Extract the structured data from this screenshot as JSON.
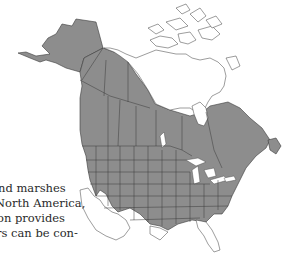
{
  "figure": {
    "type": "range-map",
    "region": "North America",
    "range_color": "#8c8c8c",
    "outline_color": "#3a3a3a",
    "background": "#ffffff"
  },
  "body_text": {
    "lines": [
      {
        "text": "nd marshes",
        "offset": -2
      },
      {
        "text": "North America,",
        "offset": -5
      },
      {
        "text": "on provides",
        "offset": -3
      },
      {
        "text": "rs can be con-",
        "offset": -4
      }
    ]
  }
}
